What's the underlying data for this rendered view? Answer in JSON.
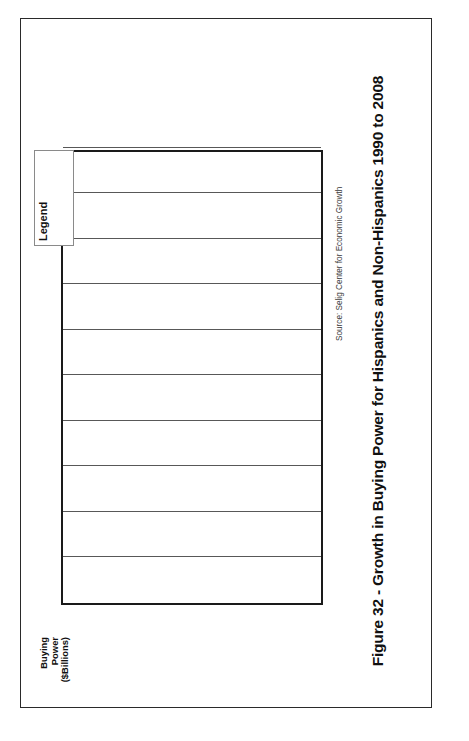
{
  "figure": {
    "caption": "Figure 32 - Growth in Buying Power for Hispanics and Non-Hispanics 1990 to 2008",
    "source": "Source: Selig Center for Economic Growth"
  },
  "legend": {
    "title": "Legend",
    "entries": [
      {
        "label": "1990",
        "color": "#808080"
      },
      {
        "label": "2000",
        "color": "#171717"
      },
      {
        "label": "2003",
        "color": "#d9d9d9"
      },
      {
        "label": "2008",
        "color": "#2b2b2b"
      }
    ]
  },
  "axis": {
    "title_line1": "Buying",
    "title_line2": "Power",
    "title_line3": "($Billions)",
    "ticks": [
      "10,000",
      "9,000",
      "8,000",
      "7,000",
      "6,000",
      "5,000",
      "4,000",
      "3,000",
      "2,000",
      "1,000",
      "0"
    ]
  },
  "categories": [
    {
      "label": "Hispanic"
    },
    {
      "label": "Non-Hispanic"
    }
  ],
  "chart_data": {
    "type": "bar",
    "orientation": "horizontal",
    "title": "Figure 32 - Growth in Buying Power for Hispanics and Non-Hispanics 1990 to 2008",
    "xlabel": "",
    "ylabel": "Buying Power ($Billions)",
    "ylim": [
      0,
      10000
    ],
    "tick_step": 1000,
    "grid": true,
    "legend_position": "top-right",
    "categories": [
      "Hispanic",
      "Non-Hispanic"
    ],
    "series": [
      {
        "name": "1990",
        "color": "#808080",
        "values": [
          212,
          4000
        ]
      },
      {
        "name": "2000",
        "color": "#171717",
        "values": [
          489,
          6300
        ]
      },
      {
        "name": "2003",
        "color": "#d9d9d9",
        "values": [
          683,
          7390
        ]
      },
      {
        "name": "2008",
        "color": "#2b2b2b",
        "values": [
          1200,
          9400
        ]
      }
    ],
    "source": "Source: Selig Center for Economic Growth"
  }
}
